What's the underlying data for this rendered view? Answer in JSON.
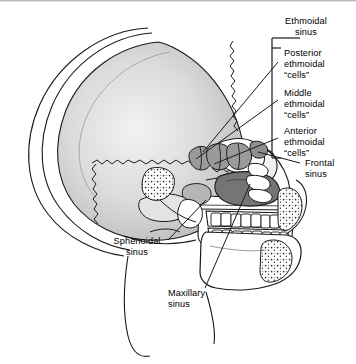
{
  "figure": {
    "kind": "anatomical-diagram",
    "title_visible": false,
    "background_color": "#ffffff",
    "line_color": "#1a1a1a",
    "bone_fill": "#ffffff",
    "bone_shade": "#d8d8d8",
    "ethmoid_cell_fill": "#9a9a9a",
    "maxillary_sinus_fill": "#757575",
    "frontal_sinus_fill": "#8f8f8f",
    "sphenoid_sinus_fill": "#b5b5b5"
  },
  "labels": {
    "group_title": "Ethmoidal\nsinus",
    "posterior": "Posterior\nethmoidal\n“cells”",
    "middle": "Middle\nethmoidal\n“cells”",
    "anterior": "Anterior\nethmoidal\n“cells”",
    "frontal": "Frontal\nsinus",
    "sphenoidal": "Sphenoidal\nsinus",
    "maxillary": "Maxillary\nsinus"
  },
  "annotations": {
    "bracket": {
      "name": "ethmoidal-sinus-bracket",
      "x": 272,
      "y_top": 48,
      "y_bottom": 158,
      "tick_length": 9
    },
    "leaders": [
      {
        "name": "leader-posterior-ethmoidal",
        "from": [
          278,
          62
        ],
        "to": [
          205,
          150
        ]
      },
      {
        "name": "leader-middle-ethmoidal",
        "from": [
          278,
          100
        ],
        "to": [
          198,
          158
        ]
      },
      {
        "name": "leader-anterior-ethmoidal",
        "from": [
          278,
          138
        ],
        "to": [
          215,
          163
        ]
      },
      {
        "name": "leader-frontal-sinus",
        "from": [
          300,
          163
        ],
        "to": [
          258,
          152
        ]
      },
      {
        "name": "leader-sphenoidal-sinus",
        "from": [
          168,
          240
        ],
        "to": [
          205,
          205
        ]
      },
      {
        "name": "leader-maxillary-sinus",
        "from": [
          205,
          288
        ],
        "to": [
          248,
          186
        ]
      }
    ]
  }
}
